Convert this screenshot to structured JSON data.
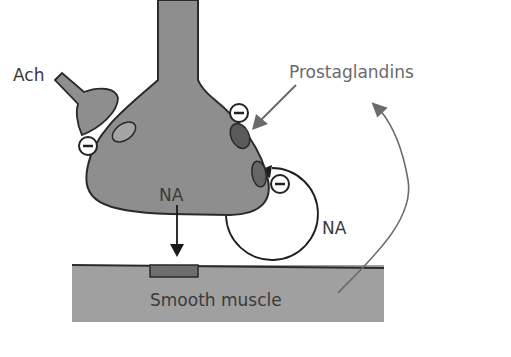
{
  "diagram": {
    "labels": {
      "ach": "Ach",
      "prostaglandins": "Prostaglandins",
      "na_release": "NA",
      "na_feedback": "NA",
      "smooth_muscle": "Smooth muscle"
    },
    "inhibition_symbol": "−",
    "colors": {
      "terminal_fill": "#8e8e8e",
      "muscle_fill": "#a0a0a0",
      "outline": "#2a2a2a",
      "receptor_light": "#9a9a9a",
      "receptor_dark": "#5a5a5a",
      "muscle_receptor": "#6e6e6e",
      "grey_arrow": "#6b6b6b"
    }
  }
}
